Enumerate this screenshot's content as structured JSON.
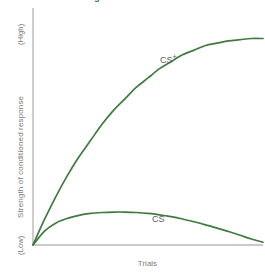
{
  "heading": {
    "text": "...the conditioning occurs to the CS+"
  },
  "axes": {
    "y_high_label": "(High)",
    "y_title": "Strength of conditioned response",
    "y_low_label": "(Low)",
    "x_title": "Trials",
    "axis_color": "#b9b9b9"
  },
  "labels": {
    "cs_plus_base": "CS",
    "cs_plus_sup": "+",
    "cs_minus_base": "CS",
    "cs_minus_sup": "−"
  },
  "chart_data": {
    "type": "line",
    "title": "",
    "xlabel": "Trials",
    "ylabel": "Strength of conditioned response",
    "xlim": [
      0,
      100
    ],
    "ylim": [
      0,
      100
    ],
    "ytick_labels": [
      "(Low)",
      "(High)"
    ],
    "xtick_labels": [],
    "grid": false,
    "legend": "inline-annotations",
    "line_color": "#3f7a3f",
    "series": [
      {
        "name": "CS+",
        "label_position": {
          "x": 57,
          "y": 72
        },
        "x": [
          0,
          5,
          10,
          15,
          20,
          25,
          30,
          35,
          40,
          45,
          50,
          55,
          60,
          65,
          70,
          75,
          80,
          85,
          90,
          95,
          100
        ],
        "values": [
          0,
          11,
          21,
          30,
          38,
          45,
          52,
          58,
          63,
          68,
          72,
          76,
          79,
          82,
          84,
          86,
          87,
          88,
          88.5,
          89,
          89
        ]
      },
      {
        "name": "CS−",
        "label_position": {
          "x": 54,
          "y": 11
        },
        "x": [
          0,
          5,
          10,
          15,
          20,
          25,
          30,
          35,
          40,
          45,
          50,
          55,
          60,
          65,
          70,
          75,
          80,
          85,
          90,
          95,
          100
        ],
        "values": [
          0,
          6,
          9.5,
          11.5,
          12.8,
          13.6,
          14,
          14.2,
          14.2,
          14,
          13.6,
          13,
          12.2,
          11.2,
          10,
          8.7,
          7.3,
          5.8,
          4.2,
          2.6,
          1.2
        ]
      }
    ]
  }
}
